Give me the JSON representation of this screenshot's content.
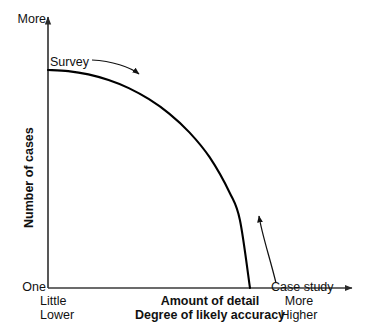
{
  "chart_data": {
    "type": "line",
    "title": "",
    "subtitle": "",
    "xlabel": "Amount of detail",
    "xlabel2": "Degree of likely accuracy",
    "ylabel": "Number of cases",
    "grid": false,
    "legend": "none",
    "axes": {
      "y_top_tick_label": "More",
      "y_bottom_tick_label": "One",
      "x_left_tick_labels": [
        "Little",
        "Lower"
      ],
      "x_right_tick_labels": [
        "More",
        "Higher"
      ],
      "xlim_labels": [
        "Little / Lower",
        "More / Higher"
      ],
      "ylim_labels": [
        "One",
        "More"
      ],
      "x_axis_arrow": true,
      "y_axis_arrow": true
    },
    "series": [
      {
        "name": "tradeoff-curve",
        "description": "Quarter-ellipse declining curve: many cases with little detail (survey) down to one case with much detail (case study)",
        "x": [
          0.0,
          0.1,
          0.2,
          0.3,
          0.4,
          0.5,
          0.6,
          0.7,
          0.8,
          0.9,
          0.95,
          1.0
        ],
        "y": [
          1.0,
          0.995,
          0.98,
          0.954,
          0.917,
          0.866,
          0.8,
          0.714,
          0.6,
          0.436,
          0.312,
          0.0
        ],
        "color": "#000000"
      }
    ],
    "annotations": [
      {
        "name": "survey",
        "text": "Survey",
        "points_to": "upper-left end of curve",
        "arrow": "curved-right-down"
      },
      {
        "name": "case-study",
        "text": "Case study",
        "points_to": "lower-right end of curve",
        "arrow": "curved-up-left"
      }
    ]
  },
  "labels": {
    "more_top": "More",
    "one": "One",
    "survey": "Survey",
    "case_study": "Case study",
    "ylabel": "Number of cases",
    "little": "Little",
    "lower": "Lower",
    "more_right": "More",
    "higher": "Higher",
    "xlabel_line1": "Amount of detail",
    "xlabel_line2": "Degree of likely accuracy"
  },
  "colors": {
    "ink": "#000000",
    "background": "#ffffff",
    "axis": "#333333"
  }
}
